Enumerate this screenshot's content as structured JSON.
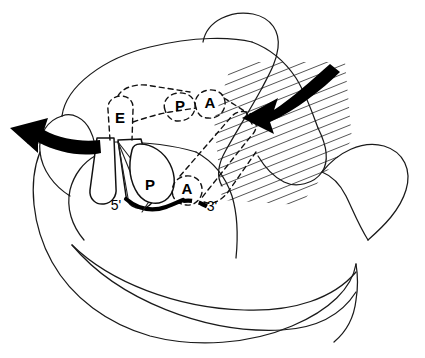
{
  "figure": {
    "background_color": "#ffffff",
    "line_color": "#1a1a1a",
    "hatch_color": "#555555",
    "arrow_color": "#000000"
  },
  "sites": {
    "hybrid_e": "E",
    "hybrid_p": "P",
    "hybrid_a": "A",
    "classical_p": "P",
    "classical_a": "A"
  },
  "mrna": {
    "five_prime": "5'",
    "three_prime": "3'"
  },
  "icons": {
    "exit_arrow": "exit-arrow-icon",
    "entry_arrow": "entry-arrow-icon",
    "hatch_region": "hatched-region-icon"
  }
}
